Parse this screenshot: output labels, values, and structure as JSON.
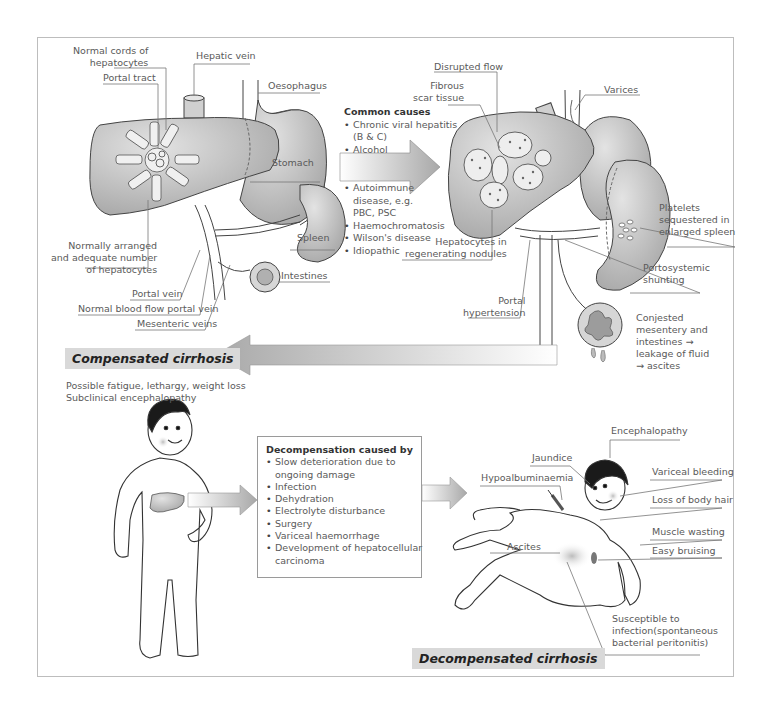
{
  "normal_liver": {
    "labels": {
      "normal_cords": "Normal cords of\nhepatocytes",
      "portal_tract": "Portal tract",
      "hepatic_vein": "Hepatic vein",
      "oesophagus": "Oesophagus",
      "stomach": "Stomach",
      "spleen": "Spleen",
      "intestines": "Intestines",
      "normal_hepatocytes": "Normally arranged\nand adequate number\nof hepatocytes",
      "portal_vein": "Portal vein",
      "normal_flow": "Normal blood flow portal vein",
      "mesenteric_veins": "Mesenteric veins"
    }
  },
  "common_causes": {
    "title": "Common causes",
    "group1": [
      "Chronic viral hepatitis\n(B & C)",
      "Alcohol"
    ],
    "group2": [
      "Autoimmune\ndisease, e.g.\nPBC, PSC",
      "Haemochromatosis",
      "Wilson's disease",
      "Idiopathic"
    ]
  },
  "cirrhotic_liver": {
    "labels": {
      "disrupted_flow": "Disrupted flow",
      "fibrous_scar": "Fibrous\nscar tissue",
      "varices": "Varices",
      "platelets": "Platelets\nsequestered in\nenlarged spleen",
      "hepatocytes_nodules": "Hepatocytes in\nregenerating nodules",
      "portosystemic": "Portosystemic\nshunting",
      "portal_hypertension": "Portal\nhypertension",
      "congested": "Conjested\nmesentery and\nintestines →\nleakage of fluid\n→ ascites"
    }
  },
  "compensated": {
    "title": "Compensated cirrhosis",
    "symptoms": [
      "Possible fatigue, lethargy, weight loss",
      "Subclinical encephalopathy"
    ]
  },
  "decompensation": {
    "title": "Decompensation caused by",
    "items": [
      "Slow deterioration due to\nongoing damage",
      "Infection",
      "Dehydration",
      "Electrolyte disturbance",
      "Surgery",
      "Variceal haemorrhage",
      "Development of hepatocellular\ncarcinoma"
    ]
  },
  "decompensated": {
    "title": "Decompensated cirrhosis",
    "labels": {
      "encephalopathy": "Encephalopathy",
      "jaundice": "Jaundice",
      "hypoalbuminaemia": "Hypoalbuminaemia",
      "variceal_bleeding": "Variceal bleeding",
      "loss_body_hair": "Loss of body hair",
      "muscle_wasting": "Muscle wasting",
      "easy_bruising": "Easy bruising",
      "ascites": "Ascites",
      "infection": "Susceptible to\ninfection(spontaneous\nbacterial peritonitis)"
    }
  },
  "colors": {
    "organ_fill": "#bdbdbd",
    "organ_dark": "#9a9a9a",
    "label_bg": "#d9d9d9",
    "line": "#444444",
    "text": "#5a5a5a"
  }
}
